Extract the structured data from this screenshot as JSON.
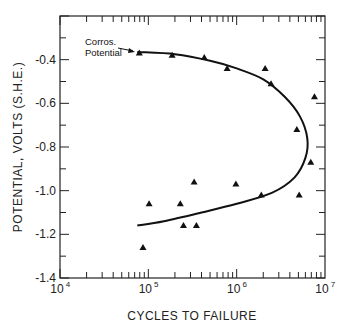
{
  "chart_data": {
    "type": "scatter",
    "title": "",
    "xlabel": "CYCLES TO FAILURE",
    "ylabel": "POTENTIAL, VOLTS (S.H.E.)",
    "xscale": "log",
    "xlim": [
      10000,
      10000000
    ],
    "ylim": [
      -1.4,
      -0.2
    ],
    "x_tick_labels": [
      "10^4",
      "10^5",
      "10^6",
      "10^7"
    ],
    "x_tick_display": [
      {
        "base": "10",
        "exp": "4"
      },
      {
        "base": "10",
        "exp": "5"
      },
      {
        "base": "10",
        "exp": "6"
      },
      {
        "base": "10",
        "exp": "7"
      }
    ],
    "y_ticks": [
      -0.4,
      -0.6,
      -0.8,
      -1.0,
      -1.2,
      -1.4
    ],
    "y_tick_labels": [
      "-0.4",
      "-0.6",
      "-0.8",
      "-1.0",
      "-1.2",
      "-1.4"
    ],
    "grid": false,
    "legend": null,
    "annotations": [
      {
        "text_line1": "Corros.",
        "text_line2": "Potential",
        "points_to": {
          "x": 79000,
          "y": -0.37
        }
      }
    ],
    "series": [
      {
        "name": "data",
        "marker": "triangle",
        "points": [
          {
            "x": 79000,
            "y": -0.37
          },
          {
            "x": 186000,
            "y": -0.38
          },
          {
            "x": 430000,
            "y": -0.39
          },
          {
            "x": 780000,
            "y": -0.44
          },
          {
            "x": 2100000,
            "y": -0.44
          },
          {
            "x": 2450000,
            "y": -0.51
          },
          {
            "x": 7600000,
            "y": -0.57
          },
          {
            "x": 4800000,
            "y": -0.72
          },
          {
            "x": 6900000,
            "y": -0.87
          },
          {
            "x": 980000,
            "y": -0.97
          },
          {
            "x": 1900000,
            "y": -1.02
          },
          {
            "x": 5100000,
            "y": -1.02
          },
          {
            "x": 330000,
            "y": -0.96
          },
          {
            "x": 102000,
            "y": -1.06
          },
          {
            "x": 230000,
            "y": -1.06
          },
          {
            "x": 250000,
            "y": -1.16
          },
          {
            "x": 350000,
            "y": -1.16
          },
          {
            "x": 87000,
            "y": -1.26
          }
        ]
      },
      {
        "name": "fit-curve",
        "type": "line",
        "points": [
          {
            "x": 75000,
            "y": -0.365
          },
          {
            "x": 200000,
            "y": -0.375
          },
          {
            "x": 500000,
            "y": -0.405
          },
          {
            "x": 1000000,
            "y": -0.44
          },
          {
            "x": 2000000,
            "y": -0.49
          },
          {
            "x": 3500000,
            "y": -0.57
          },
          {
            "x": 5200000,
            "y": -0.66
          },
          {
            "x": 6300000,
            "y": -0.76
          },
          {
            "x": 6000000,
            "y": -0.85
          },
          {
            "x": 4500000,
            "y": -0.94
          },
          {
            "x": 2500000,
            "y": -1.01
          },
          {
            "x": 1000000,
            "y": -1.06
          },
          {
            "x": 400000,
            "y": -1.1
          },
          {
            "x": 150000,
            "y": -1.14
          },
          {
            "x": 75000,
            "y": -1.16
          }
        ]
      }
    ]
  }
}
